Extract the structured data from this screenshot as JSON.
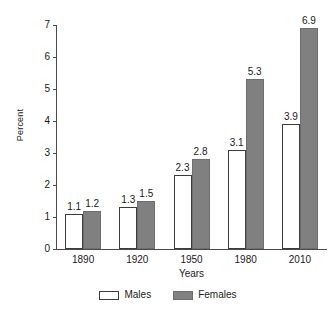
{
  "chart_data": {
    "type": "bar",
    "title": "",
    "subtitle": "",
    "xlabel": "Years",
    "ylabel": "Percent",
    "categories": [
      "1890",
      "1920",
      "1950",
      "1980",
      "2010"
    ],
    "series": [
      {
        "name": "Males",
        "color": "#ffffff",
        "values": [
          1.1,
          1.3,
          2.3,
          3.1,
          3.9
        ]
      },
      {
        "name": "Females",
        "color": "#808080",
        "values": [
          1.2,
          1.5,
          2.8,
          5.3,
          6.9
        ]
      }
    ],
    "ylim": [
      0,
      7
    ],
    "y_ticks": [
      "0",
      "1",
      "2",
      "3",
      "4",
      "5",
      "6",
      "7"
    ],
    "grid": false,
    "legend_position": "bottom",
    "data_labels": true,
    "value_labels": {
      "males": [
        "1.1",
        "1.3",
        "2.3",
        "3.1",
        "3.9"
      ],
      "females": [
        "1.2",
        "1.5",
        "2.8",
        "5.3",
        "6.9"
      ]
    }
  },
  "legend": {
    "items": [
      {
        "label": "Males"
      },
      {
        "label": "Females"
      }
    ]
  },
  "colors": {
    "axis": "#4a4a4a",
    "text": "#1a1a1a",
    "males_fill": "#ffffff",
    "males_stroke": "#3c3c3c",
    "females_fill": "#808080",
    "females_stroke": "#6e6e6e",
    "background": "#ffffff"
  }
}
